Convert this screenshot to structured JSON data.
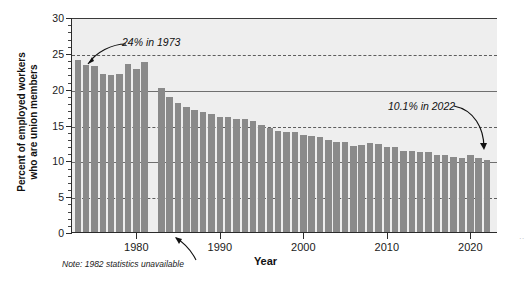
{
  "chart_data": {
    "type": "bar",
    "title": "",
    "xlabel": "Year",
    "ylabel": "Percent of employed workers who are union members",
    "ylim": [
      0,
      30
    ],
    "xlim": [
      1972.3,
      2023.2
    ],
    "yticks": [
      0,
      5,
      10,
      15,
      20,
      25,
      30
    ],
    "ytick_labels": [
      "0",
      "5",
      "10",
      "15",
      "20",
      "25",
      "30"
    ],
    "xticks": [
      1980,
      1990,
      2000,
      2010,
      2020
    ],
    "xtick_labels": [
      "1980",
      "1990",
      "2000",
      "2010",
      "2020"
    ],
    "grid": "horizontal",
    "legend": "none",
    "bar_color": "#8a8a8a",
    "plot_background": "#eeeeee",
    "categories": [
      1973,
      1974,
      1975,
      1976,
      1977,
      1978,
      1979,
      1980,
      1981,
      1983,
      1984,
      1985,
      1986,
      1987,
      1988,
      1989,
      1990,
      1991,
      1992,
      1993,
      1994,
      1995,
      1996,
      1997,
      1998,
      1999,
      2000,
      2001,
      2002,
      2003,
      2004,
      2005,
      2006,
      2007,
      2008,
      2009,
      2010,
      2011,
      2012,
      2013,
      2014,
      2015,
      2016,
      2017,
      2018,
      2019,
      2020,
      2021,
      2022
    ],
    "values": [
      24.0,
      23.3,
      23.2,
      22.0,
      21.9,
      22.0,
      23.5,
      22.8,
      23.7,
      20.1,
      18.8,
      18.0,
      17.5,
      17.0,
      16.8,
      16.4,
      16.1,
      16.1,
      15.8,
      15.8,
      15.5,
      14.9,
      14.5,
      14.1,
      13.9,
      13.9,
      13.5,
      13.4,
      13.3,
      12.9,
      12.5,
      12.5,
      12.0,
      12.1,
      12.4,
      12.3,
      11.9,
      11.8,
      11.3,
      11.3,
      11.1,
      11.1,
      10.7,
      10.7,
      10.5,
      10.3,
      10.8,
      10.3,
      10.1
    ],
    "missing_years": [
      1982
    ],
    "annotations": [
      {
        "text": "24% in 1973",
        "points_to_year": 1973,
        "points_to_value": 24.0
      },
      {
        "text": "10.1% in 2022",
        "points_to_year": 2022,
        "points_to_value": 10.1
      }
    ],
    "note": "Note: 1982 statistics unavailable"
  },
  "axis": {
    "ylabel_line1": "Percent of employed workers",
    "ylabel_line2": "who are union members",
    "xlabel": "Year"
  },
  "annotations": {
    "left": "24% in 1973",
    "right": "10.1% in 2022"
  },
  "note": "Note: 1982 statistics unavailable",
  "edge_artifact": "··"
}
